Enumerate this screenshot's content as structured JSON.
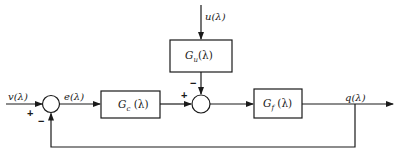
{
  "diagram": {
    "type": "control-loop-block-diagram",
    "colors": {
      "line": "#1a1a1a",
      "background": "#ffffff"
    },
    "signals": {
      "input": "v(λ)",
      "error": "e(λ)",
      "disturbance": "u(λ)",
      "output": "q(λ)"
    },
    "blocks": {
      "controller": "G_c (λ)",
      "controller_main": "G",
      "controller_sub": "c",
      "controller_arg": " (λ)",
      "disturbance": "G_u(λ)",
      "disturbance_main": "G",
      "disturbance_sub": "u",
      "disturbance_arg": "(λ)",
      "plant": "G_f (λ)",
      "plant_main": "G",
      "plant_sub": "f",
      "plant_arg": " (λ)"
    },
    "summing_junctions": {
      "left": {
        "plus": "+",
        "minus": "−"
      },
      "right": {
        "plus": "+",
        "minus": "−"
      }
    },
    "edges": [
      {
        "from": "v(λ)",
        "to": "sum-left",
        "sign": "+"
      },
      {
        "from": "sum-left",
        "to": "G_c",
        "label": "e(λ)"
      },
      {
        "from": "G_c",
        "to": "sum-right",
        "sign": "+"
      },
      {
        "from": "u(λ)",
        "to": "G_u"
      },
      {
        "from": "G_u",
        "to": "sum-right",
        "sign": "−"
      },
      {
        "from": "sum-right",
        "to": "G_f"
      },
      {
        "from": "G_f",
        "to": "output",
        "label": "q(λ)"
      },
      {
        "from": "output",
        "to": "sum-left",
        "sign": "−",
        "kind": "feedback"
      }
    ]
  }
}
